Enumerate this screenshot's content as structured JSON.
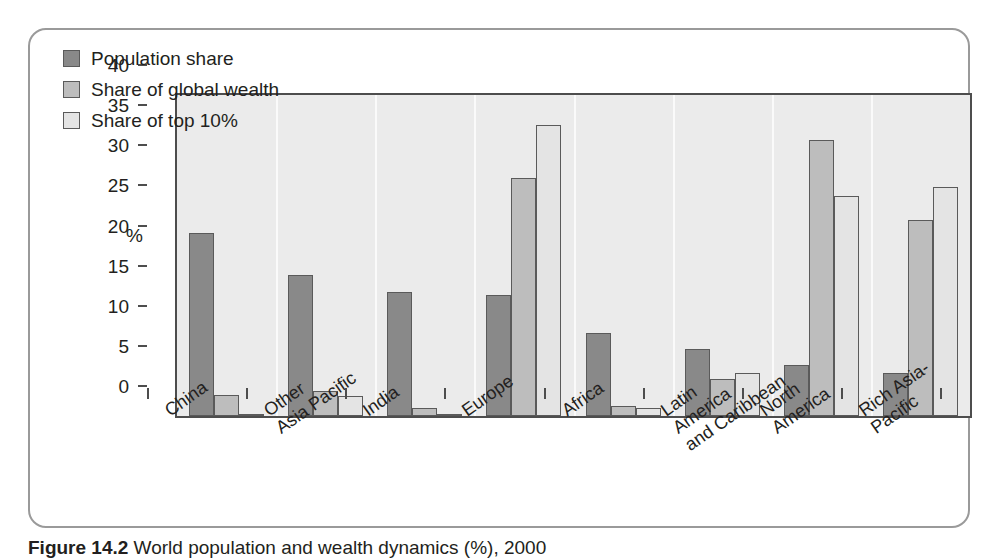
{
  "figure": {
    "caption_label": "Figure 14.2",
    "caption_text": "World population and wealth dynamics (%), 2000"
  },
  "chart_data": {
    "type": "bar",
    "title": "",
    "xlabel": "",
    "ylabel": "%",
    "ylim": [
      0,
      40
    ],
    "yticks": [
      0,
      5,
      10,
      15,
      20,
      25,
      30,
      35,
      40
    ],
    "ytick_labels": [
      "0",
      "5",
      "10",
      "15",
      "20",
      "25",
      "30",
      "35",
      "40"
    ],
    "grid": false,
    "legend_position": "top-left",
    "categories": [
      "China",
      "Other\nAsia Pacific",
      "India",
      "Europe",
      "Africa",
      "Latin\nAmerica\nand Caribbean",
      "North\nAmerica",
      "Rich Asia-\nPacific"
    ],
    "series": [
      {
        "name": "Population share",
        "color": "#898989",
        "values": [
          22.8,
          17.6,
          15.5,
          15.1,
          10.4,
          8.4,
          6.4,
          5.4
        ]
      },
      {
        "name": "Share of global wealth",
        "color": "#bdbdbd",
        "values": [
          2.6,
          3.1,
          1.0,
          29.6,
          1.2,
          4.6,
          34.4,
          24.4
        ]
      },
      {
        "name": "Share of top 10%",
        "color": "#e4e4e4",
        "values": [
          0.3,
          2.5,
          0.3,
          36.3,
          1.0,
          5.3,
          27.4,
          28.5
        ]
      }
    ]
  },
  "colors": {
    "plot_background": "#ebebeb",
    "axis": "#4d4d4d",
    "frame_border": "#9a9a9a",
    "series_1": "#898989",
    "series_2": "#bdbdbd",
    "series_3": "#e4e4e4"
  }
}
